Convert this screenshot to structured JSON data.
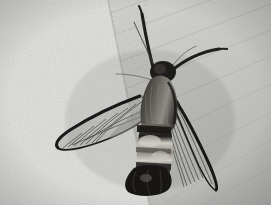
{
  "image": {
    "subject_name": "clearwing-moth",
    "scene_description": "Black and white photograph of a clearwing moth resting on a pale textured surface",
    "palette": {
      "background_light": "#d8d9d5",
      "background_smooth": "#c8c9c5",
      "background_speckle": "#e4e5e2",
      "body_dark": "#1d1b1a",
      "body_mid": "#4a4744",
      "body_highlight": "#b9b6b0",
      "wing_edge": "#0d0c0c",
      "wing_membrane": "#9e9d99",
      "frame_white": "#ffffff"
    },
    "frame": {
      "photo_width": 271,
      "photo_height": 205,
      "canvas_width": 279,
      "canvas_height": 212
    },
    "regions": [
      {
        "name": "speckled-stone-surface",
        "position": "left-and-bottom",
        "tone": "light granular"
      },
      {
        "name": "lined-wood-surface",
        "position": "upper-right",
        "tone": "smooth with diagonal grain lines"
      },
      {
        "name": "surface-boundary-edge",
        "position": "diagonal from top-center to bottom-left",
        "tone": "soft shadow line"
      }
    ],
    "anatomy": [
      {
        "name": "head",
        "tone": "very dark",
        "position": "upper-center"
      },
      {
        "name": "thorax",
        "tone": "dark furry brown-black",
        "position": "center"
      },
      {
        "name": "abdomen",
        "tone": "banded light and dark",
        "position": "lower-center"
      },
      {
        "name": "tail-tuft",
        "tone": "black fan",
        "position": "bottom-center"
      },
      {
        "name": "left-forewing",
        "tone": "transparent with dark veins and black margin",
        "position": "left, angled down-left"
      },
      {
        "name": "right-forewing",
        "tone": "transparent with dark veins and black margin",
        "position": "right, angled down-right"
      },
      {
        "name": "antenna-left",
        "tone": "thick black",
        "position": "extends up-left"
      },
      {
        "name": "antenna-right",
        "tone": "thick black",
        "position": "extends up-right"
      },
      {
        "name": "legs",
        "tone": "thin dark lines",
        "position": "under head"
      }
    ]
  }
}
